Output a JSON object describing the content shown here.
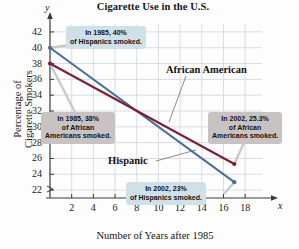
{
  "chart_data": {
    "type": "line",
    "title": "Cigarette Use in the U.S.",
    "xlabel": "Number of Years after 1985",
    "ylabel": "Percentage of Cigarette Smokers",
    "ylabel_line1": "Percentage of",
    "ylabel_line2": "Cigarette Smokers",
    "x_axis_letter": "x",
    "y_axis_letter": "y",
    "xlim": [
      0,
      19
    ],
    "ylim": [
      21,
      43
    ],
    "xticks": [
      2,
      4,
      6,
      8,
      10,
      12,
      14,
      16,
      18
    ],
    "yticks": [
      22,
      24,
      26,
      28,
      30,
      32,
      34,
      36,
      38,
      40,
      42
    ],
    "grid": true,
    "legend_position": "inline-labels",
    "series": [
      {
        "name": "Hispanic",
        "color": "#4a6f9e",
        "x": [
          0,
          17
        ],
        "values": [
          40,
          23
        ]
      },
      {
        "name": "African American",
        "color": "#7d1f33",
        "x": [
          0,
          17
        ],
        "values": [
          38,
          25.3
        ]
      }
    ],
    "annotations": [
      {
        "id": "hispanic-1985",
        "style": "blue",
        "lines": [
          "In 1985, 40%",
          "of Hispanics smoked."
        ],
        "points_to": {
          "x": 0,
          "y": 40
        }
      },
      {
        "id": "african-american-1985",
        "style": "gray",
        "lines": [
          "In 1985, 38%",
          "of African",
          "Americans smoked."
        ],
        "points_to": {
          "x": 0,
          "y": 38
        }
      },
      {
        "id": "african-american-2002",
        "style": "gray",
        "lines": [
          "In 2002, 25.3%",
          "of African",
          "Americans smoked."
        ],
        "points_to": {
          "x": 17,
          "y": 25.3
        }
      },
      {
        "id": "hispanic-2002",
        "style": "blue",
        "lines": [
          "In 2002, 23%",
          "of Hispanics smoked."
        ],
        "points_to": {
          "x": 17,
          "y": 23
        }
      }
    ],
    "series_labels": [
      {
        "text": "African American",
        "for": "African American"
      },
      {
        "text": "Hispanic",
        "for": "Hispanic"
      }
    ]
  },
  "colors": {
    "hispanic": "#4a6f9e",
    "african_american": "#7d1f33",
    "grid": "#d8dde3",
    "axis": "#3a3a3a",
    "callout_blue": "#cfe0e8",
    "callout_gray": "#c9c2c2",
    "background": "#fdfdfd"
  }
}
